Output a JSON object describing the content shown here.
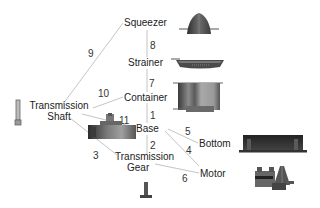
{
  "diagram": {
    "type": "exploded-parts-diagram",
    "parts": [
      {
        "id": "squeezer",
        "label": "Squeezer"
      },
      {
        "id": "strainer",
        "label": "Strainer"
      },
      {
        "id": "container",
        "label": "Container"
      },
      {
        "id": "transmission-shaft",
        "label_line1": "Transmission",
        "label_line2": "Shaft"
      },
      {
        "id": "base",
        "label": "Base"
      },
      {
        "id": "bottom",
        "label": "Bottom"
      },
      {
        "id": "transmission-gear",
        "label_line1": "Transmission",
        "label_line2": "Gear"
      },
      {
        "id": "motor",
        "label": "Motor"
      }
    ],
    "relations": [
      {
        "number": "1",
        "from": "container",
        "to": "base"
      },
      {
        "number": "2",
        "from": "base",
        "to": "transmission-gear"
      },
      {
        "number": "3",
        "from": "transmission-shaft",
        "to": "transmission-gear"
      },
      {
        "number": "4",
        "from": "base",
        "to": "motor"
      },
      {
        "number": "5",
        "from": "base",
        "to": "bottom"
      },
      {
        "number": "6",
        "from": "transmission-gear",
        "to": "motor"
      },
      {
        "number": "7",
        "from": "strainer",
        "to": "container"
      },
      {
        "number": "8",
        "from": "squeezer",
        "to": "strainer"
      },
      {
        "number": "9",
        "from": "squeezer",
        "to": "transmission-shaft"
      },
      {
        "number": "10",
        "from": "container",
        "to": "transmission-shaft"
      },
      {
        "number": "11",
        "from": "transmission-shaft",
        "to": "base"
      }
    ],
    "colors": {
      "line": "#b8b8b8",
      "text": "#222222",
      "part_dark": "#3a3a3a",
      "part_mid": "#7a7a7a",
      "part_light": "#c8c8c8"
    }
  }
}
